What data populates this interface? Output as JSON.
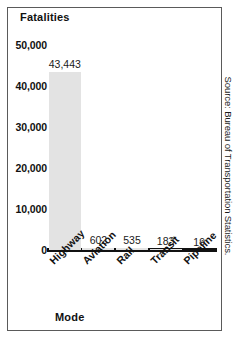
{
  "figure": {
    "background_color": "#ffffff",
    "frame_color": "#5a5a5a",
    "source_note": "Source: Bureau of Transportation Statistics."
  },
  "chart_data": {
    "type": "bar",
    "title": "",
    "subtitle": "",
    "xlabel": "Mode",
    "ylabel": "Fatalities",
    "categories": [
      "Highway",
      "Aviation",
      "Rail",
      "Transit",
      "Pipeline"
    ],
    "values": [
      43443,
      602,
      535,
      183,
      19
    ],
    "value_labels": [
      "43,443",
      "602",
      "535",
      "183",
      "19"
    ],
    "ylim": [
      0,
      50000
    ],
    "ytick_values": [
      50000,
      40000,
      30000,
      20000,
      10000,
      0
    ],
    "ytick_labels": [
      "50,000",
      "40,000",
      "30,000",
      "20,000",
      "10,000",
      "0"
    ],
    "grid": false,
    "legend": false,
    "bar_color": "#e3e3e3",
    "axis_color": "#111111"
  }
}
